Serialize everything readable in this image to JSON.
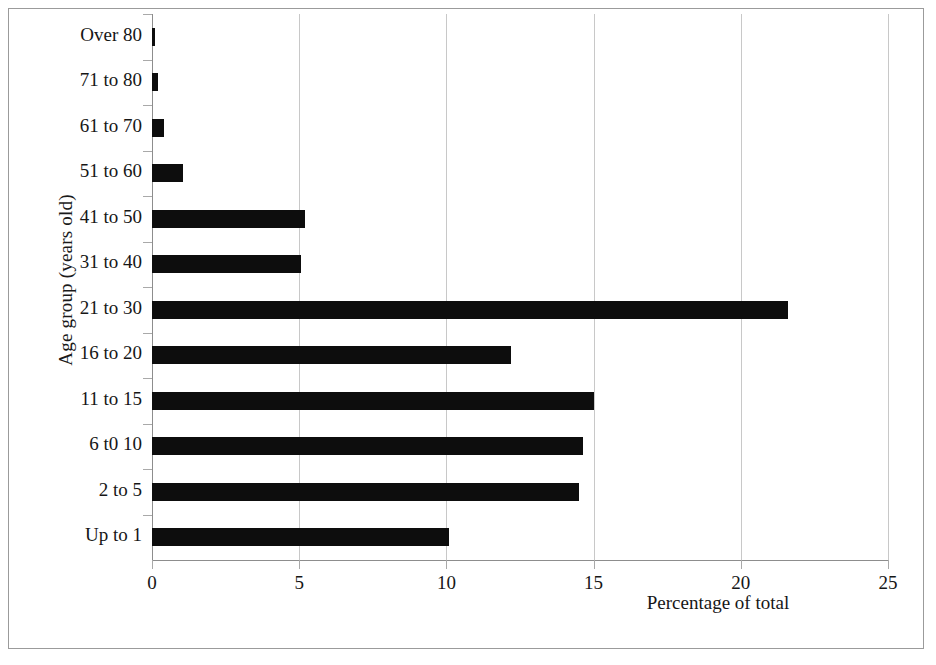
{
  "chart_data": {
    "type": "bar",
    "orientation": "horizontal",
    "title": "",
    "xlabel": "Percentage of total",
    "ylabel": "Age group (years old)",
    "xlim": [
      0,
      25
    ],
    "xticks": [
      0,
      5,
      10,
      15,
      20,
      25
    ],
    "xtick_labels": [
      "0",
      "5",
      "10",
      "15",
      "20",
      "25"
    ],
    "grid": "vertical",
    "legend": "none",
    "bar_color": "#0d0d0d",
    "gridline_color": "#c8c8c8",
    "axis_color": "#8d8d8d",
    "categories": [
      "Up to 1",
      "2 to 5",
      "6 t0 10",
      "11 to 15",
      "16 to 20",
      "21 to 30",
      "31 to 40",
      "41 to 50",
      "51 to 60",
      "61 to 70",
      "71 to 80",
      "Over 80"
    ],
    "values": [
      10.1,
      14.5,
      14.65,
      15.0,
      12.2,
      21.6,
      5.05,
      5.2,
      1.05,
      0.4,
      0.2,
      0.1
    ]
  }
}
